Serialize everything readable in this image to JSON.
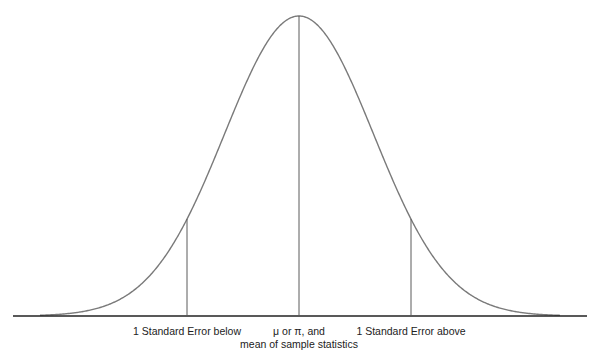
{
  "diagram": {
    "type": "normal-distribution-curve",
    "colors": {
      "curve": "#7a7a7a",
      "lines": "#5a5a5a",
      "baseline": "#222222",
      "text": "#222222"
    },
    "labels": {
      "below": "1 Standard Error below",
      "center_line1": "μ or π, and",
      "center_line2": "mean of sample statistics",
      "above": "1 Standard Error above"
    },
    "geometry": {
      "center_x": 299,
      "baseline_y": 316,
      "peak_y": 16,
      "se_below_x": 187,
      "se_above_x": 411,
      "curve_sigma_px": 74.5,
      "curve_x_start": 40,
      "curve_x_end": 560,
      "baseline_x_start": 13,
      "baseline_x_end": 587
    }
  }
}
